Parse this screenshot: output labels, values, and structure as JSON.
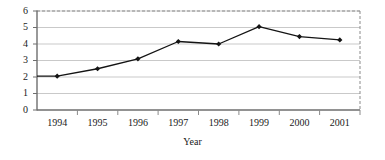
{
  "chart_data": {
    "type": "line",
    "title": "",
    "subtitle": "",
    "xlabel": "Year",
    "ylabel": "",
    "categories": [
      "1994",
      "1995",
      "1996",
      "1997",
      "1998",
      "1999",
      "2000",
      "2001"
    ],
    "values": [
      2.05,
      2.5,
      3.1,
      4.15,
      4.0,
      5.05,
      4.45,
      4.25
    ],
    "series": [
      {
        "name": "",
        "values": [
          2.05,
          2.5,
          3.1,
          4.15,
          4.0,
          5.05,
          4.45,
          4.25
        ]
      }
    ],
    "ylim": [
      0,
      6
    ],
    "y_ticks": [
      "0",
      "1",
      "2",
      "3",
      "4",
      "5",
      "6"
    ],
    "x_ticks": [
      "1994",
      "1995",
      "1996",
      "1997",
      "1998",
      "1999",
      "2000",
      "2001"
    ],
    "grid": "horizontal",
    "legend": "none",
    "line_color": "#141414",
    "marker_color": "#141414",
    "marker_shape": "diamond",
    "gridline_color": "#c9c9c9",
    "axis_color": "#6e6e6e",
    "plot_border_top": "dashed",
    "plot_border_right": "dashed",
    "background_color": "#ffffff",
    "annotations": []
  }
}
